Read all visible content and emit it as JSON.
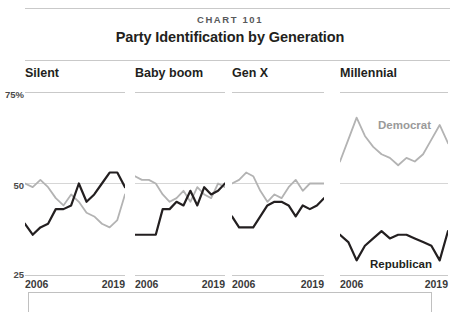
{
  "header": {
    "kicker": "CHART 101",
    "title": "Party Identification by Generation"
  },
  "axis": {
    "y_ticks": [
      "75%",
      "50",
      "25"
    ],
    "y_top_label": "75%",
    "y_mid_label": "50",
    "y_bottom_label": "25",
    "x_start": "2006",
    "x_end": "2019"
  },
  "legend": {
    "democrat": "Democrat",
    "republican": "Republican",
    "democrat_color": "#b3b3b3",
    "republican_color": "#231f20"
  },
  "panels": [
    {
      "name": "Silent",
      "x_start": "2006",
      "x_end": "2019"
    },
    {
      "name": "Baby boom",
      "x_start": "2006",
      "x_end": "2019"
    },
    {
      "name": "Gen X",
      "x_start": "2006",
      "x_end": "2019"
    },
    {
      "name": "Millennial",
      "x_start": "2006",
      "x_end": "2019"
    }
  ],
  "chart_data": {
    "type": "line",
    "title": "Party Identification by Generation",
    "subtitle": "CHART 101",
    "xlabel": "",
    "ylabel": "",
    "ylim": [
      25,
      75
    ],
    "grid": true,
    "gridlines": [
      50
    ],
    "legend_position": "inline-right-panel",
    "x": [
      2006,
      2007,
      2008,
      2009,
      2010,
      2011,
      2012,
      2013,
      2014,
      2015,
      2016,
      2017,
      2018,
      2019
    ],
    "panels": [
      {
        "name": "Silent",
        "series": [
          {
            "name": "Democrat",
            "color": "#b3b3b3",
            "values": [
              50,
              49,
              51,
              49,
              46,
              44,
              47,
              45,
              42,
              41,
              39,
              38,
              40,
              47
            ]
          },
          {
            "name": "Republican",
            "color": "#231f20",
            "values": [
              39,
              36,
              38,
              39,
              43,
              43,
              44,
              50,
              45,
              47,
              50,
              53,
              53,
              49
            ]
          }
        ]
      },
      {
        "name": "Baby boom",
        "series": [
          {
            "name": "Democrat",
            "color": "#b3b3b3",
            "values": [
              52,
              51,
              51,
              50,
              47,
              45,
              46,
              48,
              45,
              49,
              47,
              46,
              50,
              49
            ]
          },
          {
            "name": "Republican",
            "color": "#231f20",
            "values": [
              36,
              36,
              36,
              36,
              43,
              43,
              45,
              44,
              48,
              44,
              49,
              47,
              48,
              50
            ]
          }
        ]
      },
      {
        "name": "Gen X",
        "series": [
          {
            "name": "Democrat",
            "color": "#b3b3b3",
            "values": [
              50,
              51,
              53,
              52,
              48,
              45,
              47,
              46,
              49,
              51,
              48,
              50,
              50,
              50
            ]
          },
          {
            "name": "Republican",
            "color": "#231f20",
            "values": [
              41,
              38,
              38,
              38,
              41,
              44,
              45,
              45,
              44,
              41,
              44,
              43,
              44,
              46
            ]
          }
        ]
      },
      {
        "name": "Millennial",
        "series": [
          {
            "name": "Democrat",
            "color": "#b3b3b3",
            "values": [
              56,
              62,
              68,
              63,
              60,
              58,
              57,
              55,
              57,
              56,
              58,
              62,
              66,
              61
            ]
          },
          {
            "name": "Republican",
            "color": "#231f20",
            "values": [
              36,
              34,
              29,
              33,
              35,
              37,
              35,
              36,
              36,
              35,
              34,
              33,
              29,
              37
            ]
          }
        ]
      }
    ]
  }
}
